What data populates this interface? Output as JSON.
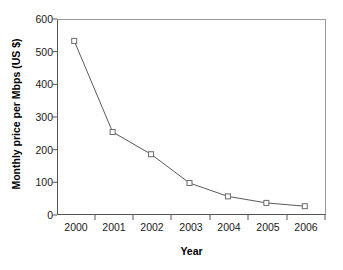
{
  "chart_data": {
    "type": "line",
    "title": "",
    "xlabel": "Year",
    "ylabel": "Monthly price per Mbps (US $)",
    "categories": [
      "2000",
      "2001",
      "2002",
      "2003",
      "2004",
      "2005",
      "2006"
    ],
    "values": [
      533,
      254,
      186,
      98,
      57,
      37,
      27
    ],
    "series": [
      {
        "name": "Monthly price per Mbps (US $)",
        "values": [
          533,
          254,
          186,
          98,
          57,
          37,
          27
        ]
      }
    ],
    "ylim": [
      0,
      600
    ],
    "yticks": [
      "0",
      "100",
      "200",
      "300",
      "400",
      "500",
      "600"
    ],
    "ytick_values": [
      0,
      100,
      200,
      300,
      400,
      500,
      600
    ],
    "xticks": [
      "2000",
      "2001",
      "2002",
      "2003",
      "2004",
      "2005",
      "2006"
    ],
    "grid": false,
    "legend": "none",
    "marker": "open-square",
    "line_color": "#5a5a5a",
    "marker_edge_color": "#6b6b6b",
    "marker_face_color": "#ffffff",
    "axis_color": "#555555",
    "text_color": "#1a1a1a",
    "background": "#ffffff"
  }
}
